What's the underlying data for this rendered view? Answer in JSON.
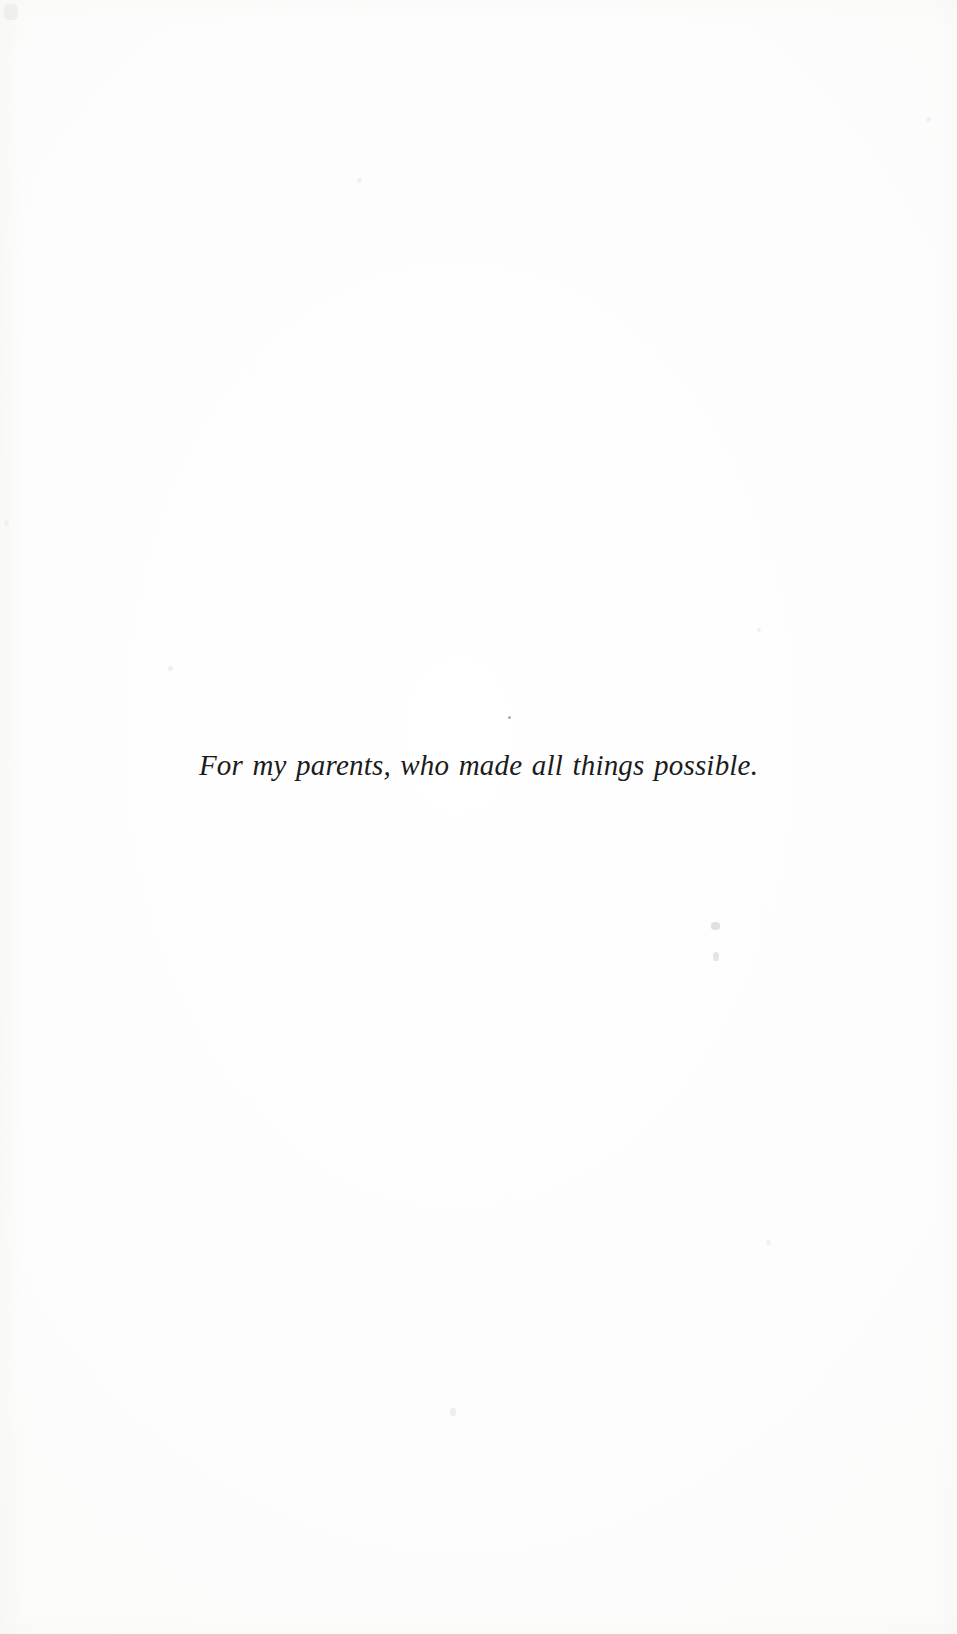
{
  "document": {
    "kind": "book-dedication-page",
    "page_background_color": "#fefefe",
    "text_color": "#1c1c1c"
  },
  "dedication": {
    "text": "For my parents, who made all things possible."
  },
  "artifacts": {
    "dot_above_dedication": "·",
    "speck_lower_right_upper": "",
    "speck_lower_right_lower": "",
    "speck_top_left_corner": "",
    "speck_mid_left": "",
    "speck_mid_right": "",
    "speck_lower_center": "",
    "speck_top_center": "",
    "speck_right_upper": "",
    "speck_right_lower": "",
    "speck_left_lower": ""
  }
}
